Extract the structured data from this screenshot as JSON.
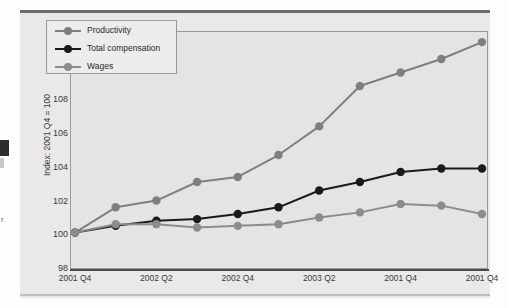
{
  "figure": {
    "background_color": "#e9e9e9",
    "plot_background_color": "#e4e4e4",
    "border_color": "#9a9a9a"
  },
  "artifacts": {
    "left_text_fragment": "r"
  },
  "legend": {
    "position": "top-left-inside",
    "entries": [
      {
        "label": "Productivity",
        "color": "#7f7f7f"
      },
      {
        "label": "Total compensation",
        "color": "#1a1a1a"
      },
      {
        "label": "Wages",
        "color": "#8c8c8c"
      }
    ]
  },
  "chart_data": {
    "type": "line",
    "title": "",
    "subtitle": "",
    "xlabel": "",
    "ylabel": "Index: 2001 Q4 = 100",
    "ylim": [
      98,
      112
    ],
    "yticks": [
      98,
      100,
      102,
      104,
      106,
      108,
      110,
      112
    ],
    "ytick_labels": [
      "98",
      "100",
      "102",
      "104",
      "106",
      "108",
      "110",
      "112"
    ],
    "grid": false,
    "x": [
      0,
      1,
      2,
      3,
      4,
      5,
      6,
      7,
      8,
      9,
      10
    ],
    "xtick_positions": [
      0,
      2,
      4,
      6,
      8,
      10
    ],
    "xtick_labels": [
      "2001 Q4",
      "2002 Q2",
      "2002 Q4",
      "2003 Q2",
      "2001 Q4",
      "2001 Q4"
    ],
    "series": [
      {
        "name": "Productivity",
        "color": "#7f7f7f",
        "values": [
          100.1,
          101.6,
          102.0,
          103.1,
          103.4,
          104.7,
          106.4,
          108.8,
          109.6,
          110.4,
          111.4
        ]
      },
      {
        "name": "Total compensation",
        "color": "#1a1a1a",
        "values": [
          100.1,
          100.5,
          100.8,
          100.9,
          101.2,
          101.6,
          102.6,
          103.1,
          103.7,
          103.9,
          103.9
        ]
      },
      {
        "name": "Wages",
        "color": "#8c8c8c",
        "values": [
          100.1,
          100.6,
          100.6,
          100.4,
          100.5,
          100.6,
          101.0,
          101.3,
          101.8,
          101.7,
          101.2
        ]
      }
    ]
  }
}
